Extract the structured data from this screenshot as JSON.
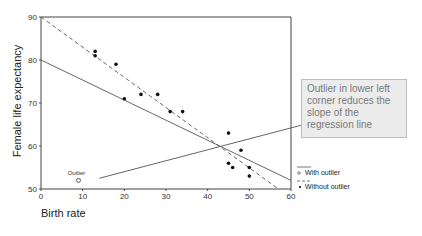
{
  "chart_data": {
    "type": "scatter",
    "title": "",
    "xlabel": "Birth rate",
    "ylabel": "Female life expectancy",
    "xlim": [
      0,
      60
    ],
    "ylim": [
      50,
      90
    ],
    "x_ticks": [
      0,
      10,
      20,
      30,
      40,
      50,
      60
    ],
    "y_ticks": [
      50,
      60,
      70,
      80,
      90
    ],
    "grid": false,
    "series": [
      {
        "name": "Without outlier",
        "marker": "filled-dot",
        "points": [
          [
            13,
            82
          ],
          [
            13,
            81
          ],
          [
            18,
            79
          ],
          [
            20,
            71
          ],
          [
            24,
            72
          ],
          [
            28,
            72
          ],
          [
            31,
            68
          ],
          [
            34,
            68
          ],
          [
            45,
            63
          ],
          [
            48,
            59
          ],
          [
            45,
            56
          ],
          [
            46,
            55
          ],
          [
            50,
            55
          ],
          [
            50,
            53
          ]
        ]
      },
      {
        "name": "With outlier",
        "marker": "open-circle",
        "points": [
          [
            9,
            52
          ]
        ],
        "point_label": "Outlier"
      }
    ],
    "regression_lines": [
      {
        "name": "With outlier",
        "style": "solid",
        "from": [
          0,
          80
        ],
        "to": [
          60,
          52
        ]
      },
      {
        "name": "Without outlier",
        "style": "dashed",
        "from": [
          0,
          90
        ],
        "to": [
          57,
          50
        ]
      }
    ],
    "annotation": {
      "text": "Outlier in lower left corner reduces the slope of the regression line",
      "pointer_from": [
        14,
        52.5
      ],
      "pointer_to_box": true
    },
    "legend": {
      "position": "lower-right-outside",
      "entries": [
        {
          "label": "With outlier",
          "marker": "open-circle",
          "line": "solid"
        },
        {
          "label": "Without outlier",
          "marker": "filled-dot",
          "line": "dashed"
        }
      ]
    }
  },
  "labels": {
    "ylabel": "Female life expectancy",
    "xlabel": "Birth rate",
    "outlier": "Outlier",
    "note": "Outlier in lower left corner reduces the slope of the regression line",
    "legend_with": "With outlier",
    "legend_without": "Without outlier"
  }
}
